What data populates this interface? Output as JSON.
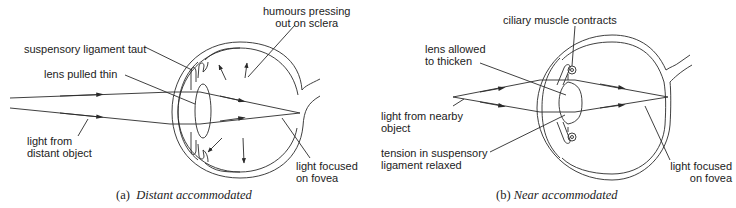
{
  "figures": [
    {
      "id": "a",
      "caption_letter": "(a)",
      "caption_text": "Distant accommodated",
      "labels": {
        "suspensory_ligament": "suspensory ligament taut",
        "lens": "lens pulled thin",
        "light_source_line1": "light from",
        "light_source_line2": "distant object",
        "humours_line1": "humours pressing",
        "humours_line2": "out on sclera",
        "focus_line1": "light focused",
        "focus_line2": "on fovea"
      }
    },
    {
      "id": "b",
      "caption_letter": "(b)",
      "caption_text": "Near accommodated",
      "labels": {
        "ciliary_muscle": "ciliary muscle contracts",
        "lens_line1": "lens allowed",
        "lens_line2": "to thicken",
        "light_source_line1": "light from nearby",
        "light_source_line2": "object",
        "tension_line1": "tension in suspensory",
        "tension_line2": "ligament relaxed",
        "focus_line1": "light focused",
        "focus_line2": "on fovea"
      }
    }
  ],
  "colors": {
    "line": "#2a2a2a",
    "background": "#ffffff"
  }
}
